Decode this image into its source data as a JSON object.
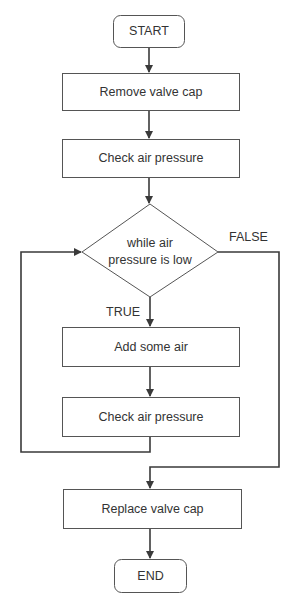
{
  "diagram": {
    "type": "flowchart",
    "colors": {
      "stroke": "#3a3a3a",
      "text": "#333333",
      "background": "#ffffff"
    },
    "nodes": {
      "start": {
        "shape": "rounded-rect",
        "label": "START"
      },
      "remove_cap": {
        "shape": "rect",
        "label": "Remove valve cap"
      },
      "check_pressure_1": {
        "shape": "rect",
        "label": "Check air pressure"
      },
      "decision": {
        "shape": "diamond",
        "label_line1": "while air",
        "label_line2": "pressure is low"
      },
      "add_air": {
        "shape": "rect",
        "label": "Add some air"
      },
      "check_pressure_2": {
        "shape": "rect",
        "label": "Check air pressure"
      },
      "replace_cap": {
        "shape": "rect",
        "label": "Replace valve cap"
      },
      "end": {
        "shape": "rounded-rect",
        "label": "END"
      }
    },
    "edge_labels": {
      "true": "TRUE",
      "false": "FALSE"
    },
    "edges": [
      {
        "from": "start",
        "to": "remove_cap"
      },
      {
        "from": "remove_cap",
        "to": "check_pressure_1"
      },
      {
        "from": "check_pressure_1",
        "to": "decision"
      },
      {
        "from": "decision",
        "to": "add_air",
        "label": "TRUE"
      },
      {
        "from": "add_air",
        "to": "check_pressure_2"
      },
      {
        "from": "check_pressure_2",
        "to": "decision",
        "note": "loop back"
      },
      {
        "from": "decision",
        "to": "replace_cap",
        "label": "FALSE"
      },
      {
        "from": "replace_cap",
        "to": "end"
      }
    ]
  }
}
